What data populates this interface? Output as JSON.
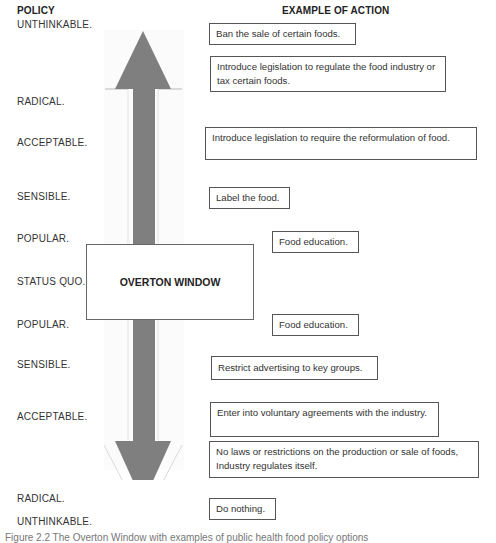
{
  "headers": {
    "policy": "POLICY",
    "action": "EXAMPLE OF ACTION"
  },
  "levels": [
    {
      "label": "UNTHINKABLE."
    },
    {
      "label": "RADICAL."
    },
    {
      "label": "ACCEPTABLE."
    },
    {
      "label": "SENSIBLE."
    },
    {
      "label": "POPULAR."
    },
    {
      "label": "STATUS QUO."
    },
    {
      "label": "POPULAR."
    },
    {
      "label": "SENSIBLE."
    },
    {
      "label": "ACCEPTABLE."
    },
    {
      "label": "RADICAL."
    },
    {
      "label": "UNTHINKABLE."
    }
  ],
  "actions": [
    {
      "text": "Ban the sale of certain foods."
    },
    {
      "text": "Introduce legislation to regulate the food industry or tax certain foods."
    },
    {
      "text": "Introduce legislation to require the reformulation of food."
    },
    {
      "text": "Label the food."
    },
    {
      "text": "Food education."
    },
    {
      "text": "Food education."
    },
    {
      "text": "Restrict advertising to key groups."
    },
    {
      "text": "Enter into voluntary agreements with the industry."
    },
    {
      "text": "No laws or restrictions on the production or sale of foods, Industry regulates itself."
    },
    {
      "text": "Do nothing."
    }
  ],
  "window": {
    "label": "OVERTON WINDOW"
  },
  "arrow": {
    "color": "#7f7f7f",
    "direction": "bidirectional-vertical"
  },
  "caption": "Figure 2.2 The Overton Window with examples of public health food policy options"
}
